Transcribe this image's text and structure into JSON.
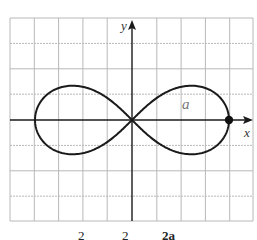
{
  "figure": {
    "x_axis_label": "x",
    "y_axis_label": "y",
    "curve_label": "a",
    "curve_name": "lemniscate",
    "marked_point": "(a, 0)"
  },
  "equation_fragments": {
    "sup1": "2",
    "sup2": "2",
    "tail": "2a"
  },
  "colors": {
    "grid": "#b5b5b5",
    "axis": "#1a1a1a",
    "curve": "#1a1a1a",
    "label_a": "#777777"
  },
  "grid": {
    "columns": 10,
    "rows": 8,
    "cell_px": [
      24.3,
      25.4
    ]
  }
}
